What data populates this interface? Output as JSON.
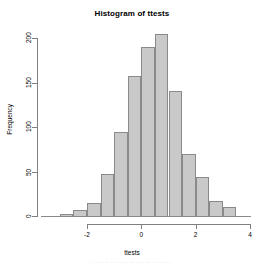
{
  "chart_data": {
    "type": "bar",
    "title": "Histogram of ttests",
    "xlabel": "ttests",
    "ylabel": "Frequency",
    "xlim": [
      -2.6,
      4.0
    ],
    "ylim": [
      0,
      210
    ],
    "grid": false,
    "legend": null,
    "bin_width": 0.5,
    "bin_edges": [
      -2.5,
      -2.0,
      -1.5,
      -1.0,
      -0.5,
      0.0,
      0.5,
      1.0,
      1.5,
      2.0,
      2.5,
      3.0,
      3.5
    ],
    "categories": [
      "-3.0 to -2.5",
      "-2.5 to -2.0",
      "-2.0 to -1.5",
      "-1.5 to -1.0",
      "-1.0 to -0.5",
      "-0.5 to 0.0",
      "0.0 to 0.5",
      "0.5 to 1.0",
      "1.0 to 1.5",
      "1.5 to 2.0",
      "2.0 to 2.5",
      "2.5 to 3.0",
      "3.0 to 3.5"
    ],
    "values": [
      2,
      7,
      15,
      47,
      94,
      157,
      190,
      205,
      141,
      70,
      44,
      17,
      10
    ],
    "bars": [
      {
        "x0": -3.0,
        "x1": -2.5,
        "value": 2
      },
      {
        "x0": -2.5,
        "x1": -2.0,
        "value": 7
      },
      {
        "x0": -2.0,
        "x1": -1.5,
        "value": 15
      },
      {
        "x0": -1.5,
        "x1": -1.0,
        "value": 47
      },
      {
        "x0": -1.0,
        "x1": -0.5,
        "value": 94
      },
      {
        "x0": -0.5,
        "x1": 0.0,
        "value": 157
      },
      {
        "x0": 0.0,
        "x1": 0.5,
        "value": 190
      },
      {
        "x0": 0.5,
        "x1": 1.0,
        "value": 205
      },
      {
        "x0": 1.0,
        "x1": 1.5,
        "value": 141
      },
      {
        "x0": 1.5,
        "x1": 2.0,
        "value": 70
      },
      {
        "x0": 2.0,
        "x1": 2.5,
        "value": 44
      },
      {
        "x0": 2.5,
        "x1": 3.0,
        "value": 17
      },
      {
        "x0": 3.0,
        "x1": 3.5,
        "value": 10
      }
    ],
    "x_ticks": [
      {
        "value": -2,
        "label": "-2"
      },
      {
        "value": 0,
        "label": "0"
      },
      {
        "value": 2,
        "label": "2"
      },
      {
        "value": 4,
        "label": "4"
      }
    ],
    "y_ticks": [
      {
        "value": 0,
        "label": "0"
      },
      {
        "value": 50,
        "label": "50"
      },
      {
        "value": 100,
        "label": "100"
      },
      {
        "value": 150,
        "label": "150"
      },
      {
        "value": 200,
        "label": "200"
      }
    ],
    "colors": {
      "bar_fill": "#c9c9c9",
      "bar_border": "#8a8a8a",
      "axis": "#808080",
      "text": "#000000",
      "background": "#ffffff"
    }
  },
  "artifact": {
    "bottom_text": ". .. .. .. . . .. ... .. . ... .. . . .. ... ."
  }
}
